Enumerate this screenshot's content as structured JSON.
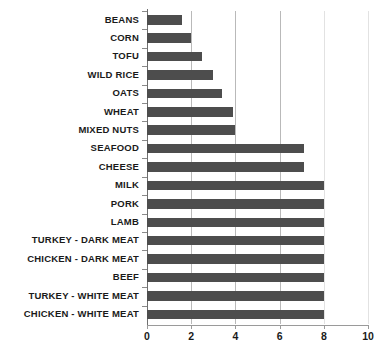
{
  "chart_data": {
    "type": "bar",
    "orientation": "horizontal",
    "title": "",
    "subtitle": "",
    "xlabel": "",
    "ylabel": "",
    "xlim": [
      0,
      10
    ],
    "xticks": [
      0,
      2,
      4,
      6,
      8,
      10
    ],
    "xtick_labels": [
      "0",
      "2",
      "4",
      "6",
      "8",
      "10"
    ],
    "grid": true,
    "grid_axis": "x",
    "legend": false,
    "legend_position": "none",
    "bar_color": "#4d4d4d",
    "background_color": "#ffffff",
    "categories": [
      "BEANS",
      "CORN",
      "TOFU",
      "WILD RICE",
      "OATS",
      "WHEAT",
      "MIXED NUTS",
      "SEAFOOD",
      "CHEESE",
      "MILK",
      "PORK",
      "LAMB",
      "TURKEY - DARK MEAT",
      "CHICKEN - DARK MEAT",
      "BEEF",
      "TURKEY - WHITE MEAT",
      "CHICKEN - WHITE MEAT"
    ],
    "values": [
      1.6,
      2.0,
      2.5,
      3.0,
      3.4,
      3.9,
      4.0,
      7.1,
      7.1,
      8.0,
      8.0,
      8.0,
      8.0,
      8.0,
      8.0,
      8.0,
      8.0
    ],
    "annotations": []
  }
}
